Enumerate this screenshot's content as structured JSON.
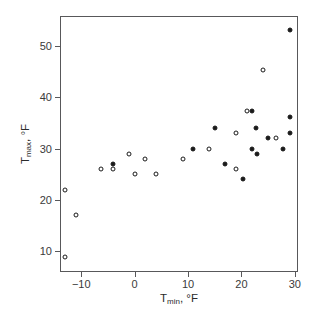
{
  "chart_data": {
    "type": "scatter",
    "title": "",
    "xlabel": "T_min, °F",
    "ylabel": "T_max, °F",
    "xlabel_parts": {
      "base": "T",
      "sub": "min",
      "unit": ", °F"
    },
    "ylabel_parts": {
      "base": "T",
      "sub": "max",
      "unit": ", °F"
    },
    "xlim": [
      -13.8,
      30.4
    ],
    "ylim": [
      6.2,
      55.6
    ],
    "xticks": [
      -10,
      0,
      10,
      20,
      30
    ],
    "xticklabels": [
      "−10",
      "0",
      "10",
      "20",
      "30"
    ],
    "yticks": [
      10,
      20,
      30,
      40,
      50
    ],
    "yticklabels": [
      "10",
      "20",
      "30",
      "40",
      "50"
    ],
    "grid": false,
    "legend": "none",
    "marker_styles": [
      "open-circle",
      "filled-circle"
    ],
    "series": [
      {
        "name": "open",
        "marker": "open-circle",
        "points": [
          [
            -13,
            22
          ],
          [
            -13,
            9
          ],
          [
            -11,
            17
          ],
          [
            -6.3,
            26
          ],
          [
            -4,
            26
          ],
          [
            -1,
            29
          ],
          [
            0,
            25
          ],
          [
            2,
            28
          ],
          [
            4,
            25
          ],
          [
            9,
            28
          ],
          [
            14,
            30
          ],
          [
            19,
            33
          ],
          [
            19,
            26
          ],
          [
            21,
            37.3
          ],
          [
            24,
            45.2
          ],
          [
            26.4,
            32
          ]
        ]
      },
      {
        "name": "filled",
        "marker": "filled-circle",
        "points": [
          [
            -4,
            27
          ],
          [
            11,
            30
          ],
          [
            15,
            34
          ],
          [
            17,
            27
          ],
          [
            20.2,
            24
          ],
          [
            22,
            37.3
          ],
          [
            22,
            30
          ],
          [
            22.8,
            34
          ],
          [
            23,
            29
          ],
          [
            25,
            32
          ],
          [
            27.8,
            30
          ],
          [
            29,
            53
          ],
          [
            29,
            36.2
          ],
          [
            29,
            33
          ]
        ]
      }
    ]
  }
}
